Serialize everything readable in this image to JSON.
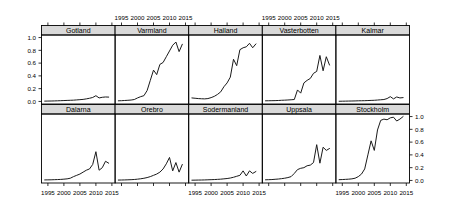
{
  "figure": {
    "type": "trellis-multipanel-line-chart",
    "rows": 2,
    "cols": 5,
    "background_color": "#ffffff",
    "line_color": "#1a1a1a",
    "strip_color": "#d9d9d9",
    "axis_color": "#000000"
  },
  "axes": {
    "y_ticks": [
      "1.0",
      "0.8",
      "0.6",
      "0.4",
      "0.2",
      "0.0"
    ],
    "y_values": [
      1.0,
      0.8,
      0.6,
      0.4,
      0.2,
      0.0
    ],
    "ylim": [
      -0.04,
      1.04
    ],
    "x_ticks": [
      "1995",
      "2000",
      "2005",
      "2010",
      "2015"
    ],
    "x_values": [
      1995,
      2000,
      2005,
      2010,
      2015
    ],
    "xlim": [
      1993,
      2016
    ],
    "y_axis_top_row_side": "left",
    "y_axis_bottom_row_side": "right",
    "x_axis_top_panels": [
      "Varmland",
      "Vasterbotten"
    ],
    "x_axis_bottom_panels": [
      "Dalarna",
      "Sodermanland",
      "Stockholm"
    ],
    "grid": false,
    "xlabel": "",
    "ylabel": ""
  },
  "chart_data": {
    "type": "line",
    "title": "",
    "subtitle": "",
    "xlabel": "",
    "ylabel": "",
    "xlim": [
      1993,
      2016
    ],
    "ylim": [
      0.0,
      1.0
    ],
    "grid": false,
    "legend": "none",
    "x": [
      1994,
      1995,
      1996,
      1997,
      1998,
      1999,
      2000,
      2001,
      2002,
      2003,
      2004,
      2005,
      2006,
      2007,
      2008,
      2009,
      2010,
      2011,
      2012,
      2013,
      2014
    ],
    "panel_layout": [
      [
        "Gotland",
        "Varmland",
        "Halland",
        "Vasterbotten",
        "Kalmar"
      ],
      [
        "Dalarna",
        "Orebro",
        "Sodermanland",
        "Uppsala",
        "Stockholm"
      ]
    ],
    "series": [
      {
        "name": "Gotland",
        "row": 0,
        "col": 0,
        "values": [
          0.005,
          0.006,
          0.007,
          0.008,
          0.01,
          0.012,
          0.014,
          0.016,
          0.018,
          0.02,
          0.024,
          0.028,
          0.032,
          0.04,
          0.05,
          0.062,
          0.09,
          0.055,
          0.065,
          0.07,
          0.068
        ]
      },
      {
        "name": "Varmland",
        "row": 0,
        "col": 1,
        "values": [
          0.01,
          0.012,
          0.015,
          0.018,
          0.022,
          0.03,
          0.055,
          0.075,
          0.09,
          0.17,
          0.33,
          0.49,
          0.42,
          0.58,
          0.61,
          0.7,
          0.79,
          0.88,
          0.93,
          0.78,
          0.895
        ]
      },
      {
        "name": "Halland",
        "row": 0,
        "col": 2,
        "values": [
          0.055,
          0.05,
          0.045,
          0.042,
          0.04,
          0.045,
          0.06,
          0.08,
          0.11,
          0.15,
          0.23,
          0.29,
          0.38,
          0.66,
          0.56,
          0.81,
          0.84,
          0.855,
          0.91,
          0.84,
          0.9
        ]
      },
      {
        "name": "Vasterbotten",
        "row": 0,
        "col": 3,
        "values": [
          0.01,
          0.011,
          0.012,
          0.013,
          0.015,
          0.018,
          0.02,
          0.023,
          0.026,
          0.03,
          0.18,
          0.13,
          0.29,
          0.33,
          0.36,
          0.44,
          0.47,
          0.72,
          0.48,
          0.7,
          0.57
        ]
      },
      {
        "name": "Kalmar",
        "row": 0,
        "col": 4,
        "values": [
          0.003,
          0.004,
          0.005,
          0.006,
          0.007,
          0.008,
          0.01,
          0.011,
          0.012,
          0.014,
          0.016,
          0.018,
          0.022,
          0.026,
          0.03,
          0.045,
          0.075,
          0.04,
          0.07,
          0.055,
          0.06
        ]
      },
      {
        "name": "Dalarna",
        "row": 1,
        "col": 0,
        "values": [
          0.008,
          0.009,
          0.01,
          0.012,
          0.014,
          0.016,
          0.02,
          0.025,
          0.035,
          0.06,
          0.08,
          0.1,
          0.13,
          0.16,
          0.18,
          0.25,
          0.45,
          0.16,
          0.2,
          0.3,
          0.27
        ]
      },
      {
        "name": "Orebro",
        "row": 1,
        "col": 1,
        "values": [
          0.006,
          0.007,
          0.008,
          0.01,
          0.012,
          0.015,
          0.02,
          0.026,
          0.034,
          0.045,
          0.06,
          0.08,
          0.1,
          0.13,
          0.18,
          0.26,
          0.36,
          0.15,
          0.28,
          0.13,
          0.25
        ]
      },
      {
        "name": "Sodermanland",
        "row": 1,
        "col": 2,
        "values": [
          0.004,
          0.005,
          0.006,
          0.007,
          0.008,
          0.01,
          0.012,
          0.014,
          0.017,
          0.02,
          0.025,
          0.03,
          0.038,
          0.05,
          0.065,
          0.08,
          0.15,
          0.07,
          0.15,
          0.11,
          0.14
        ]
      },
      {
        "name": "Uppsala",
        "row": 1,
        "col": 3,
        "values": [
          0.01,
          0.012,
          0.014,
          0.018,
          0.022,
          0.028,
          0.035,
          0.045,
          0.06,
          0.11,
          0.17,
          0.19,
          0.2,
          0.23,
          0.24,
          0.28,
          0.56,
          0.27,
          0.52,
          0.47,
          0.5
        ]
      },
      {
        "name": "Stockholm",
        "row": 1,
        "col": 4,
        "values": [
          0.012,
          0.014,
          0.017,
          0.02,
          0.025,
          0.035,
          0.06,
          0.1,
          0.18,
          0.4,
          0.62,
          0.47,
          0.79,
          0.94,
          0.96,
          0.95,
          0.98,
          0.99,
          0.93,
          0.96,
          1.0
        ]
      }
    ]
  }
}
